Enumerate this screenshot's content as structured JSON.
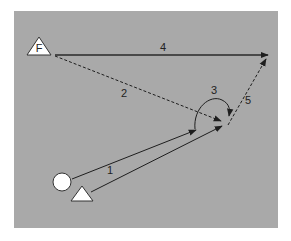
{
  "diagram": {
    "background_color": "#a9a9a9",
    "line_color": "#1e1e1e",
    "nodes": {
      "start_circle": {
        "label": ""
      },
      "start_triangle": {
        "label": ""
      },
      "flag_triangle": {
        "label": "F"
      }
    },
    "edges": [
      {
        "id": "1",
        "label": "1",
        "style": "solid"
      },
      {
        "id": "2",
        "label": "2",
        "style": "dashed"
      },
      {
        "id": "3",
        "label": "3",
        "style": "solid-arc"
      },
      {
        "id": "4",
        "label": "4",
        "style": "solid"
      },
      {
        "id": "5",
        "label": "5",
        "style": "dashed"
      }
    ]
  }
}
